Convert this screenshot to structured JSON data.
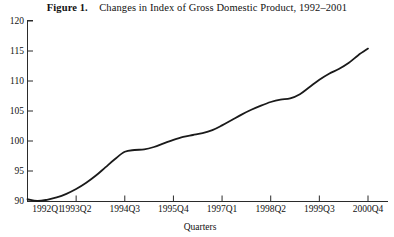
{
  "figure": {
    "label": "Figure 1.",
    "caption": "Changes in Index of Gross Domestic Product, 1992–2001"
  },
  "chart_data": {
    "type": "line",
    "title": "Changes in Index of Gross Domestic Product, 1992–2001",
    "xlabel": "Quarters",
    "ylabel": "",
    "xlim": [
      0,
      35
    ],
    "ylim": [
      90,
      120
    ],
    "ytick_values": [
      90,
      95,
      100,
      105,
      110,
      115,
      120
    ],
    "ytick_labels": [
      "90",
      "95",
      "100",
      "105",
      "110",
      "115",
      "120"
    ],
    "xtick_indices": [
      0,
      5,
      10,
      15,
      20,
      25,
      30,
      35
    ],
    "xtick_labels": [
      "1992Q1",
      "1993Q2",
      "1994Q3",
      "1995Q4",
      "1997Q1",
      "1998Q2",
      "1999Q3",
      "2000Q4"
    ],
    "grid": false,
    "legend": false,
    "line_color": "#1a1a1a",
    "line_width": 1.8,
    "categories": [
      "1992Q1",
      "1992Q2",
      "1992Q3",
      "1992Q4",
      "1993Q1",
      "1993Q2",
      "1993Q3",
      "1993Q4",
      "1994Q1",
      "1994Q2",
      "1994Q3",
      "1994Q4",
      "1995Q1",
      "1995Q2",
      "1995Q3",
      "1995Q4",
      "1996Q1",
      "1996Q2",
      "1996Q3",
      "1996Q4",
      "1997Q1",
      "1997Q2",
      "1997Q3",
      "1997Q4",
      "1998Q1",
      "1998Q2",
      "1998Q3",
      "1998Q4",
      "1999Q1",
      "1999Q2",
      "1999Q3",
      "1999Q4",
      "2000Q1",
      "2000Q2",
      "2000Q3",
      "2000Q4"
    ],
    "values": [
      90.3,
      90.0,
      90.2,
      90.6,
      91.2,
      92.0,
      93.0,
      94.2,
      95.6,
      97.0,
      98.2,
      98.5,
      98.6,
      99.0,
      99.6,
      100.2,
      100.7,
      101.0,
      101.3,
      101.8,
      102.6,
      103.5,
      104.4,
      105.2,
      105.9,
      106.5,
      106.9,
      107.1,
      107.8,
      109.0,
      110.2,
      111.2,
      112.0,
      113.0,
      114.3,
      115.4
    ],
    "series": [
      {
        "name": "Index of Gross Domestic Product",
        "values": [
          90.3,
          90.0,
          90.2,
          90.6,
          91.2,
          92.0,
          93.0,
          94.2,
          95.6,
          97.0,
          98.2,
          98.5,
          98.6,
          99.0,
          99.6,
          100.2,
          100.7,
          101.0,
          101.3,
          101.8,
          102.6,
          103.5,
          104.4,
          105.2,
          105.9,
          106.5,
          106.9,
          107.1,
          107.8,
          109.0,
          110.2,
          111.2,
          112.0,
          113.0,
          114.3,
          115.4
        ]
      }
    ]
  }
}
